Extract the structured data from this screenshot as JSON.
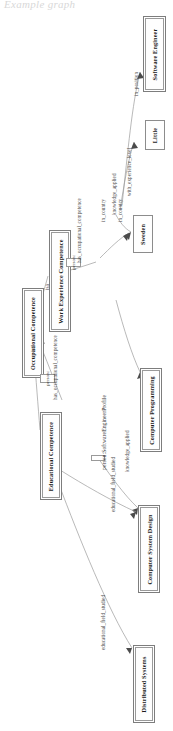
{
  "page": {
    "header_text": "Example graph",
    "orientation": "rotated-90",
    "diagram_type": "rdf-knowledge-graph"
  },
  "nodes": [
    {
      "id": "software_engineer",
      "label": "Software Engineer",
      "kind": "class-node"
    },
    {
      "id": "little",
      "label": "Little",
      "kind": "literal-node"
    },
    {
      "id": "sweden",
      "label": "Sweden",
      "kind": "literal-node"
    },
    {
      "id": "work_experience",
      "label": "Work Experience Competence",
      "kind": "class-node"
    },
    {
      "id": "occupational",
      "label": "Occupational Competence",
      "kind": "class-node"
    },
    {
      "id": "educational",
      "label": "Educational Competence",
      "kind": "class-node"
    },
    {
      "id": "computer_programming",
      "label": "Computer Programming",
      "kind": "literal-node"
    },
    {
      "id": "computer_system_design",
      "label": "Computer System Design",
      "kind": "literal-node"
    },
    {
      "id": "distributed_systems",
      "label": "Distributed Systems",
      "kind": "literal-node"
    }
  ],
  "instance_nodes": [
    {
      "id": "person_profile",
      "label": "person:SoftwareEngineerProfile"
    },
    {
      "id": "person_a",
      "label": "person:"
    },
    {
      "id": "person_b",
      "label": "person:"
    }
  ],
  "edges": [
    {
      "id": "e_in_position",
      "label": "in_position",
      "from": "person_profile",
      "to": "software_engineer"
    },
    {
      "id": "e_exp_level",
      "label": "with_experience_level",
      "from": "person_profile",
      "to": "little"
    },
    {
      "id": "e_in_country_1",
      "label": "in_country",
      "from": "person_profile",
      "to": "sweden"
    },
    {
      "id": "e_in_country_2",
      "label": "in_country",
      "from": "person_a",
      "to": "sweden"
    },
    {
      "id": "e_has_occ_1",
      "label": "has_occupational_competence",
      "from": "person_a",
      "to": "work_experience"
    },
    {
      "id": "e_has_occ_2",
      "label": "has_occupational_competence",
      "from": "person_b",
      "to": "occupational"
    },
    {
      "id": "e_isa_1",
      "label": "isa",
      "from": "work_experience",
      "to": "occupational"
    },
    {
      "id": "e_isa_2",
      "label": "isa",
      "from": "educational",
      "to": "occupational"
    },
    {
      "id": "e_knowledge_1",
      "label": "knowledge_applied",
      "from": "person_profile",
      "to": "computer_programming"
    },
    {
      "id": "e_knowledge_2",
      "label": "knowledge_applied",
      "from": "person_b",
      "to": "computer_system_design"
    },
    {
      "id": "e_edu_field_1",
      "label": "educational_field_studied",
      "from": "educational",
      "to": "computer_system_design"
    },
    {
      "id": "e_edu_field_2",
      "label": "educational_field_studied",
      "from": "educational",
      "to": "distributed_systems"
    }
  ]
}
